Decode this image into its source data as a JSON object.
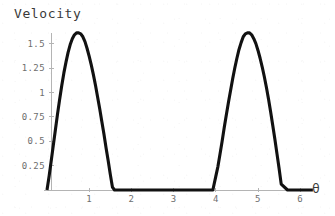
{
  "chart_data": {
    "type": "line",
    "title": "Velocity",
    "xlabel": "θ",
    "ylabel": "",
    "xlim": [
      0,
      6.35
    ],
    "ylim": [
      0,
      1.72
    ],
    "grid": false,
    "legend": null,
    "xticks": [
      1,
      2,
      3,
      4,
      5,
      6
    ],
    "xtick_labels": [
      "1",
      "2",
      "3",
      "4",
      "5",
      "6"
    ],
    "yticks": [
      0.25,
      0.5,
      0.75,
      1,
      1.25,
      1.5
    ],
    "ytick_labels": [
      "0.25",
      "0.5",
      "0.75",
      "1",
      "1.25",
      "1.5"
    ],
    "line_color": "#111111",
    "axis_color": "#b4b4b4",
    "text_color": "#6e6e6e",
    "background_color": "#ffffff",
    "series": [
      {
        "name": "velocity",
        "x": [
          0.0,
          0.05,
          0.1,
          0.15,
          0.2,
          0.25,
          0.3,
          0.35,
          0.4,
          0.45,
          0.5,
          0.55,
          0.6,
          0.65,
          0.7,
          0.75,
          0.8,
          0.85,
          0.9,
          0.95,
          1.0,
          1.05,
          1.1,
          1.15,
          1.2,
          1.25,
          1.3,
          1.35,
          1.4,
          1.45,
          1.5,
          1.55,
          1.6,
          1.8,
          2.0,
          2.5,
          3.0,
          3.5,
          3.8,
          3.9,
          3.93,
          4.0,
          4.05,
          4.1,
          4.15,
          4.2,
          4.25,
          4.3,
          4.35,
          4.4,
          4.45,
          4.5,
          4.55,
          4.6,
          4.65,
          4.7,
          4.75,
          4.8,
          4.85,
          4.9,
          4.95,
          5.0,
          5.05,
          5.1,
          5.15,
          5.2,
          5.25,
          5.3,
          5.35,
          5.4,
          5.45,
          5.5,
          5.55,
          5.7,
          5.9,
          6.1,
          6.3
        ],
        "y": [
          0.0,
          0.14,
          0.3,
          0.46,
          0.62,
          0.78,
          0.93,
          1.07,
          1.2,
          1.31,
          1.41,
          1.49,
          1.55,
          1.59,
          1.61,
          1.61,
          1.6,
          1.57,
          1.52,
          1.45,
          1.37,
          1.28,
          1.18,
          1.07,
          0.95,
          0.83,
          0.7,
          0.57,
          0.43,
          0.3,
          0.16,
          0.03,
          0.0,
          0.0,
          0.0,
          0.0,
          0.0,
          0.0,
          0.0,
          0.0,
          0.0,
          0.14,
          0.24,
          0.37,
          0.5,
          0.64,
          0.77,
          0.9,
          1.02,
          1.14,
          1.25,
          1.35,
          1.44,
          1.51,
          1.57,
          1.6,
          1.61,
          1.61,
          1.59,
          1.55,
          1.5,
          1.43,
          1.35,
          1.26,
          1.16,
          1.05,
          0.93,
          0.8,
          0.66,
          0.52,
          0.37,
          0.22,
          0.06,
          0.0,
          0.0,
          0.0,
          0.0
        ]
      }
    ]
  },
  "axis_geometry": {
    "origin_px": {
      "x": 47,
      "y": 190
    },
    "x_units_per_px": 42.2,
    "y_units_per_px": 97.6,
    "x_axis_end_px": 303,
    "y_axis_top_px": 33
  }
}
